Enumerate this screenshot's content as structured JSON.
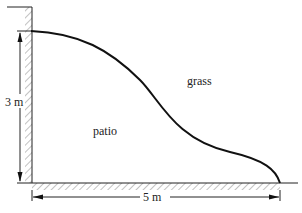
{
  "diagram": {
    "regions": {
      "grass_label": "grass",
      "patio_label": "patio"
    },
    "dimensions": {
      "height_label": "3 m",
      "width_label": "5 m"
    },
    "colors": {
      "line": "#111111",
      "hatch": "#555555",
      "background": "#ffffff"
    }
  }
}
